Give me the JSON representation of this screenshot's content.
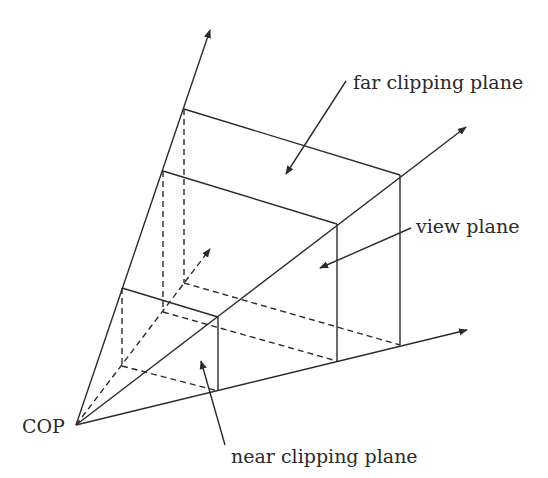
{
  "diagram": {
    "labels": {
      "cop": "COP",
      "far_clipping_plane": "far clipping plane",
      "view_plane": "view plane",
      "near_clipping_plane": "near clipping plane"
    },
    "colors": {
      "line": "#2b2b2b",
      "text": "#2a2a2a",
      "background": "#ffffff"
    },
    "points": {
      "cop": [
        76,
        425
      ],
      "axis_up_tip": [
        211,
        27
      ],
      "axis_diag_tip": [
        468,
        125
      ],
      "axis_right_tip": [
        470,
        329
      ],
      "center_dashed_tip": [
        211,
        247
      ]
    }
  }
}
